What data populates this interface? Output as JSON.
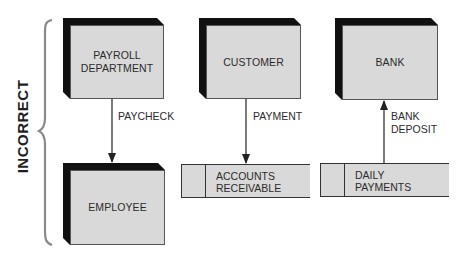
{
  "diagram": {
    "side_label": "INCORRECT",
    "entities": [
      {
        "id": "payroll",
        "label_line1": "PAYROLL",
        "label_line2": "DEPARTMENT"
      },
      {
        "id": "employee",
        "label": "EMPLOYEE"
      },
      {
        "id": "customer",
        "label": "CUSTOMER"
      },
      {
        "id": "bank",
        "label": "BANK"
      }
    ],
    "data_stores": [
      {
        "id": "accounts_receivable",
        "label_line1": "ACCOUNTS",
        "label_line2": "RECEIVABLE"
      },
      {
        "id": "daily_payments",
        "label_line1": "DAILY",
        "label_line2": "PAYMENTS"
      }
    ],
    "flows": [
      {
        "from": "PAYROLL DEPARTMENT",
        "to": "EMPLOYEE",
        "label": "PAYCHECK"
      },
      {
        "from": "CUSTOMER",
        "to": "ACCOUNTS RECEIVABLE",
        "label": "PAYMENT"
      },
      {
        "from": "DAILY PAYMENTS",
        "to": "BANK",
        "label_line1": "BANK",
        "label_line2": "DEPOSIT"
      }
    ],
    "colors": {
      "box_face": "#d9d9d9",
      "box_shadow": "#111111",
      "line": "#333333",
      "brace": "#8a8a8a"
    }
  }
}
